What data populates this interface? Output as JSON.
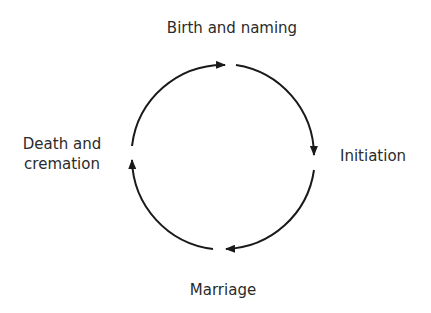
{
  "diagram": {
    "type": "cycle",
    "direction": "clockwise",
    "stages": [
      {
        "id": "top",
        "label": "Birth and naming"
      },
      {
        "id": "right",
        "label": "Initiation"
      },
      {
        "id": "bottom",
        "label": "Marriage"
      },
      {
        "id": "left",
        "label_lines": [
          "Death and",
          "cremation"
        ]
      }
    ],
    "colors": {
      "stroke": "#1a1a1a",
      "text": "#2b2b2b",
      "background": "#ffffff"
    }
  }
}
